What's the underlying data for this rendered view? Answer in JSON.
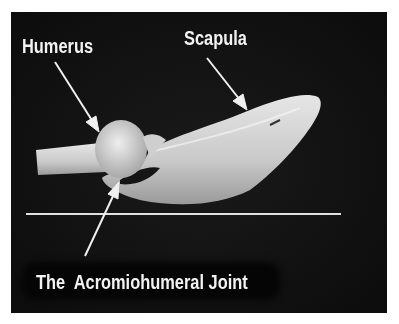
{
  "figure": {
    "background_color": "#111111",
    "labels": {
      "humerus": "Humerus",
      "scapula": "Scapula",
      "joint": "The  Acromiohumeral Joint"
    },
    "reference_line_color": "#e0e0e0",
    "arrow_color": "#f0f0f0"
  }
}
